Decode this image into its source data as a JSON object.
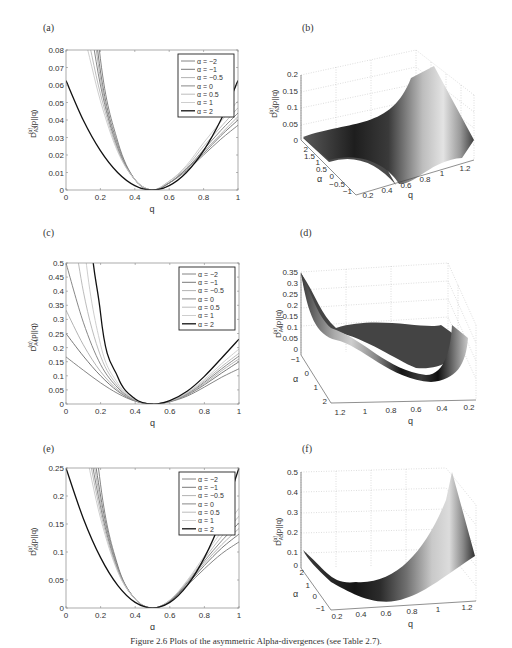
{
  "figure": {
    "caption": "Figure 2.6  Plots of the asymmetric Alpha-divergences (see Table 2.7).",
    "panels": [
      {
        "id": "a",
        "label": "(a)"
      },
      {
        "id": "b",
        "label": "(b)"
      },
      {
        "id": "c",
        "label": "(c)"
      },
      {
        "id": "d",
        "label": "(d)"
      },
      {
        "id": "e",
        "label": "(e)"
      },
      {
        "id": "f",
        "label": "(f)"
      }
    ]
  },
  "legend": {
    "entries": [
      "α = −2",
      "α = −1",
      "α = −0.5",
      "α = 0",
      "α = 0.5",
      "α = 1",
      "α = 2"
    ],
    "colors": [
      "#777777",
      "#6a6a6a",
      "#aaaaaa",
      "#7a7a7a",
      "#b4b4b4",
      "#c8c8c8",
      "#111111"
    ]
  },
  "chart_data": [
    {
      "id": "a",
      "type": "line",
      "title": "",
      "xlabel": "q",
      "ylabel": "D_A3^(α)(p||q)",
      "xlim": [
        0,
        1
      ],
      "ylim": [
        0,
        0.08
      ],
      "xticks": [
        "0",
        "0.2",
        "0.4",
        "0.6",
        "0.8",
        "1"
      ],
      "yticks": [
        "0",
        "0.01",
        "0.02",
        "0.03",
        "0.04",
        "0.05",
        "0.06",
        "0.07",
        "0.08"
      ],
      "legend_position": "upper right",
      "grid": false,
      "x": [
        0,
        0.1,
        0.2,
        0.3,
        0.4,
        0.5,
        0.6,
        0.7,
        0.8,
        0.9,
        1.0
      ],
      "series": [
        {
          "name": "α = −2",
          "values": [
            0.3,
            0.19,
            0.075,
            0.028,
            0.006,
            0,
            0.004,
            0.011,
            0.02,
            0.029,
            0.037
          ]
        },
        {
          "name": "α = −1",
          "values": [
            0.25,
            0.16,
            0.068,
            0.026,
            0.006,
            0,
            0.004,
            0.012,
            0.021,
            0.031,
            0.04
          ]
        },
        {
          "name": "α = −0.5",
          "values": [
            0.2,
            0.14,
            0.064,
            0.025,
            0.006,
            0,
            0.004,
            0.012,
            0.022,
            0.032,
            0.042
          ]
        },
        {
          "name": "α = 0",
          "values": [
            0.17,
            0.12,
            0.06,
            0.024,
            0.006,
            0,
            0.004,
            0.012,
            0.023,
            0.034,
            0.044
          ]
        },
        {
          "name": "α = 0.5",
          "values": [
            0.14,
            0.1,
            0.055,
            0.023,
            0.006,
            0,
            0.005,
            0.013,
            0.025,
            0.036,
            0.047
          ]
        },
        {
          "name": "α = 1",
          "values": [
            0.12,
            0.09,
            0.051,
            0.022,
            0.006,
            0,
            0.005,
            0.014,
            0.027,
            0.039,
            0.051
          ]
        },
        {
          "name": "α = 2",
          "values": [
            0.0625,
            0.04,
            0.0225,
            0.01,
            0.0025,
            0,
            0.0025,
            0.01,
            0.0225,
            0.04,
            0.0625
          ]
        }
      ]
    },
    {
      "id": "b",
      "type": "surface",
      "zlabel": "D_A3^(α)(p||q)",
      "xlabel": "q",
      "ylabel": "α",
      "xticks": [
        "0.2",
        "0.4",
        "0.6",
        "0.8",
        "1",
        "1.2"
      ],
      "yticks": [
        "−1",
        "−0.5",
        "0",
        "0.5",
        "1",
        "1.5",
        "2"
      ],
      "zticks": [
        "0",
        "0.05",
        "0.1",
        "0.15",
        "0.2"
      ],
      "zlim": [
        0,
        0.2
      ],
      "grid": true
    },
    {
      "id": "c",
      "type": "line",
      "xlabel": "q",
      "ylabel": "D_A4^(α)(p||q)",
      "xlim": [
        0,
        1
      ],
      "ylim": [
        0,
        0.5
      ],
      "xticks": [
        "0",
        "0.2",
        "0.4",
        "0.6",
        "0.8",
        "1"
      ],
      "yticks": [
        "0",
        "0.05",
        "0.1",
        "0.15",
        "0.2",
        "0.25",
        "0.3",
        "0.35",
        "0.4",
        "0.45",
        "0.5"
      ],
      "legend_position": "upper right",
      "grid": false,
      "x": [
        0,
        0.1,
        0.2,
        0.3,
        0.4,
        0.5,
        0.6,
        0.7,
        0.8,
        0.9,
        1.0
      ],
      "series": [
        {
          "name": "α = −2",
          "values": [
            0.167,
            0.12,
            0.075,
            0.037,
            0.01,
            0,
            0.008,
            0.028,
            0.06,
            0.095,
            0.125
          ]
        },
        {
          "name": "α = −1",
          "values": [
            0.25,
            0.17,
            0.1,
            0.045,
            0.011,
            0,
            0.009,
            0.032,
            0.068,
            0.11,
            0.15
          ]
        },
        {
          "name": "α = −0.5",
          "values": [
            0.333,
            0.21,
            0.115,
            0.05,
            0.012,
            0,
            0.009,
            0.034,
            0.072,
            0.118,
            0.16
          ]
        },
        {
          "name": "α = 0",
          "values": [
            0.5,
            0.29,
            0.14,
            0.057,
            0.013,
            0,
            0.01,
            0.036,
            0.077,
            0.125,
            0.17
          ]
        },
        {
          "name": "α = 0.5",
          "values": [
            0.8,
            0.4,
            0.17,
            0.064,
            0.014,
            0,
            0.01,
            0.038,
            0.082,
            0.133,
            0.18
          ]
        },
        {
          "name": "α = 1",
          "values": [
            1.5,
            0.6,
            0.21,
            0.073,
            0.015,
            0,
            0.011,
            0.04,
            0.087,
            0.143,
            0.195
          ]
        },
        {
          "name": "α = 2",
          "values": [
            5.0,
            1.2,
            0.32,
            0.095,
            0.018,
            0,
            0.012,
            0.045,
            0.098,
            0.163,
            0.23
          ]
        }
      ]
    },
    {
      "id": "d",
      "type": "surface",
      "zlabel": "D_A4^(α)(p||q)",
      "xlabel": "q",
      "ylabel": "α",
      "xticks": [
        "1.2",
        "1",
        "0.8",
        "0.6",
        "0.4",
        "0.2"
      ],
      "yticks": [
        "−1",
        "0",
        "1",
        "2"
      ],
      "zticks": [
        "0",
        "0.05",
        "0.1",
        "0.15",
        "0.2",
        "0.25",
        "0.3",
        "0.35"
      ],
      "zlim": [
        0,
        0.35
      ],
      "grid": true
    },
    {
      "id": "e",
      "type": "line",
      "xlabel": "q",
      "ylabel": "D_A5^(α)(p||q)",
      "xlim": [
        0,
        1
      ],
      "ylim": [
        0,
        0.25
      ],
      "xticks": [
        "0",
        "0.2",
        "0.4",
        "0.6",
        "0.8",
        "1"
      ],
      "yticks": [
        "0",
        "0.05",
        "0.1",
        "0.15",
        "0.2",
        "0.25"
      ],
      "legend_position": "upper right",
      "grid": false,
      "x": [
        0,
        0.1,
        0.2,
        0.3,
        0.4,
        0.5,
        0.6,
        0.7,
        0.8,
        0.9,
        1.0
      ],
      "series": [
        {
          "name": "α = −2",
          "values": [
            1.2,
            0.55,
            0.22,
            0.075,
            0.016,
            0,
            0.012,
            0.04,
            0.07,
            0.097,
            0.118
          ]
        },
        {
          "name": "α = −1",
          "values": [
            0.9,
            0.45,
            0.2,
            0.072,
            0.016,
            0,
            0.012,
            0.042,
            0.076,
            0.107,
            0.132
          ]
        },
        {
          "name": "α = −0.5",
          "values": [
            0.75,
            0.4,
            0.19,
            0.07,
            0.016,
            0,
            0.013,
            0.044,
            0.08,
            0.113,
            0.142
          ]
        },
        {
          "name": "α = 0",
          "values": [
            0.62,
            0.36,
            0.18,
            0.068,
            0.016,
            0,
            0.013,
            0.045,
            0.084,
            0.12,
            0.152
          ]
        },
        {
          "name": "α = 0.5",
          "values": [
            0.52,
            0.33,
            0.17,
            0.066,
            0.016,
            0,
            0.014,
            0.047,
            0.088,
            0.128,
            0.164
          ]
        },
        {
          "name": "α = 1",
          "values": [
            0.44,
            0.3,
            0.16,
            0.064,
            0.016,
            0,
            0.014,
            0.049,
            0.093,
            0.137,
            0.178
          ]
        },
        {
          "name": "α = 2",
          "values": [
            0.25,
            0.16,
            0.09,
            0.04,
            0.01,
            0,
            0.01,
            0.04,
            0.09,
            0.16,
            0.25
          ]
        }
      ]
    },
    {
      "id": "f",
      "type": "surface",
      "zlabel": "D_A5^(α)(p||q)",
      "xlabel": "q",
      "ylabel": "α",
      "xticks": [
        "0.2",
        "0.4",
        "0.6",
        "0.8",
        "1",
        "1.2"
      ],
      "yticks": [
        "−1",
        "0",
        "1",
        "2"
      ],
      "zticks": [
        "0",
        "0.1",
        "0.2",
        "0.3",
        "0.4",
        "0.5"
      ],
      "zlim": [
        0,
        0.5
      ],
      "grid": true
    }
  ]
}
